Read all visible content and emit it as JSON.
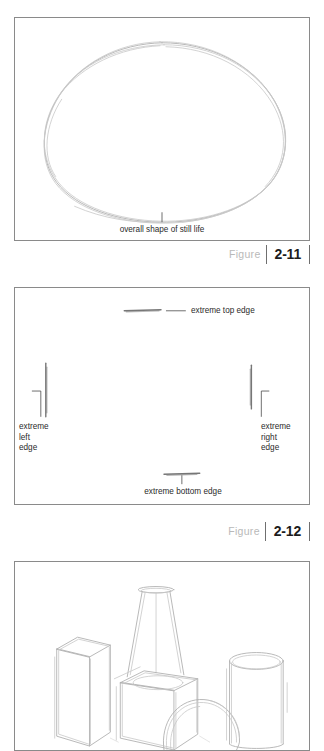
{
  "page": {
    "background": "#ffffff",
    "pencil_color": "#b0b0b0",
    "panel_border_color": "#8a8a8a",
    "caption_number_color": "#1c1c1c",
    "caption_word_color": "#b9b9b9"
  },
  "figures": [
    {
      "id": "figure-2-11",
      "caption_word": "Figure",
      "caption_number": "2-11",
      "annotations": [
        {
          "name": "overall-shape-label",
          "text": "overall shape of still life"
        }
      ],
      "subject": "loose pencil outline of the overall silhouette of a still life"
    },
    {
      "id": "figure-2-12",
      "caption_word": "Figure",
      "caption_number": "2-12",
      "annotations": [
        {
          "name": "extreme-top-edge-label",
          "text": "extreme top edge"
        },
        {
          "name": "extreme-left-edge-label",
          "text": "extreme\nleft\nedge"
        },
        {
          "name": "extreme-right-edge-label",
          "text": "extreme\nright\nedge"
        },
        {
          "name": "extreme-bottom-edge-label",
          "text": "extreme bottom edge"
        }
      ],
      "subject": "four short pencil tick marks locating the extreme top, left, right and bottom edges of a still life"
    },
    {
      "id": "figure-solids",
      "subject": "pencil sketch of basic geometric solids: a tall rectangular box, a cone resting on a cube, a sphere and a cylinder"
    }
  ]
}
